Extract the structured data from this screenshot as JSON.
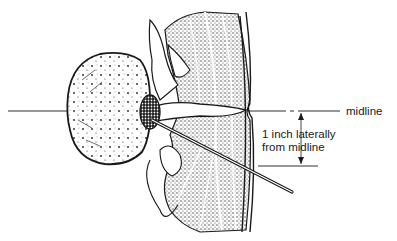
{
  "figure": {
    "type": "anatomical-illustration",
    "colors": {
      "ink": "#1a1a1a",
      "background": "#ffffff",
      "stipple": "#555555"
    }
  },
  "labels": {
    "midline": "midline",
    "lateral_line1": "1 inch laterally",
    "lateral_line2": "from midline"
  },
  "annotations": {
    "dimension": "1 inch",
    "arrows": [
      "arrow-up",
      "arrow-down"
    ]
  }
}
